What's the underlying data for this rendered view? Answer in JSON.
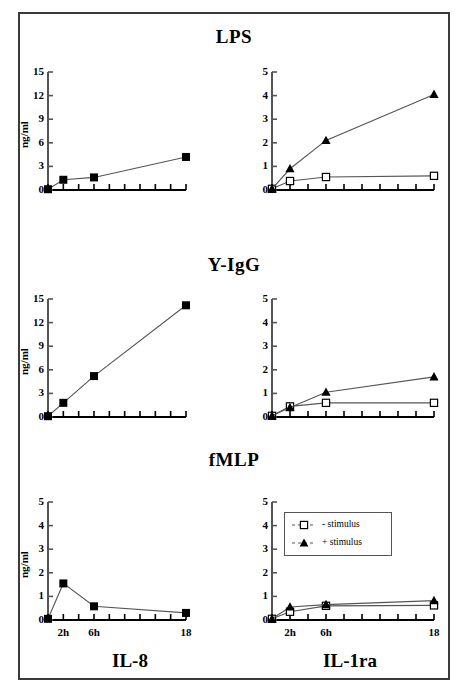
{
  "figure": {
    "ylabel": "ng/ml",
    "column_labels": [
      "IL-8",
      "IL-1ra"
    ],
    "row_titles": [
      "LPS",
      "Y-IgG",
      "fMLP"
    ],
    "xtick_labels": [
      "2h",
      "6h",
      "18"
    ],
    "legend": {
      "entries": [
        {
          "label": "- stimulus",
          "marker": "open-square"
        },
        {
          "label": "+ stimulus",
          "marker": "filled-triangle"
        }
      ]
    },
    "colors": {
      "ink": "#000000",
      "frame": "#3a3a3a",
      "line": "#555555"
    }
  },
  "chart_data": [
    {
      "type": "line",
      "title": "LPS",
      "panel": "IL-8",
      "xlabel": "",
      "ylabel": "ng/ml",
      "x": [
        0,
        2,
        6,
        18
      ],
      "xtick_values": [
        0,
        2,
        4,
        6,
        8,
        10,
        12,
        14,
        16,
        18
      ],
      "xlim": [
        0,
        18
      ],
      "ylim": [
        0,
        15
      ],
      "yticks": [
        0,
        3,
        6,
        9,
        12,
        15
      ],
      "grid": false,
      "series": [
        {
          "name": "IL-8",
          "marker": "filled-square",
          "values": [
            0.1,
            1.3,
            1.6,
            4.2
          ]
        }
      ]
    },
    {
      "type": "line",
      "title": "LPS",
      "panel": "IL-1ra",
      "xlabel": "",
      "ylabel": "",
      "x": [
        0,
        2,
        6,
        18
      ],
      "xtick_values": [
        0,
        2,
        4,
        6,
        8,
        10,
        12,
        14,
        16,
        18
      ],
      "xlim": [
        0,
        18
      ],
      "ylim": [
        0,
        5
      ],
      "yticks": [
        0,
        1,
        2,
        3,
        4,
        5
      ],
      "grid": false,
      "series": [
        {
          "name": "- stimulus",
          "marker": "open-square",
          "values": [
            0.05,
            0.38,
            0.55,
            0.6
          ]
        },
        {
          "name": "+ stimulus",
          "marker": "filled-triangle",
          "values": [
            0.05,
            0.9,
            2.1,
            4.05
          ]
        }
      ]
    },
    {
      "type": "line",
      "title": "Y-IgG",
      "panel": "IL-8",
      "xlabel": "",
      "ylabel": "ng/ml",
      "x": [
        0,
        2,
        6,
        18
      ],
      "xtick_values": [
        0,
        2,
        4,
        6,
        8,
        10,
        12,
        14,
        16,
        18
      ],
      "xlim": [
        0,
        18
      ],
      "ylim": [
        0,
        15
      ],
      "yticks": [
        0,
        3,
        6,
        9,
        12,
        15
      ],
      "grid": false,
      "series": [
        {
          "name": "IL-8",
          "marker": "filled-square",
          "values": [
            0.1,
            1.8,
            5.2,
            14.2
          ]
        }
      ]
    },
    {
      "type": "line",
      "title": "Y-IgG",
      "panel": "IL-1ra",
      "xlabel": "",
      "ylabel": "",
      "x": [
        0,
        2,
        6,
        18
      ],
      "xtick_values": [
        0,
        2,
        4,
        6,
        8,
        10,
        12,
        14,
        16,
        18
      ],
      "xlim": [
        0,
        18
      ],
      "ylim": [
        0,
        5
      ],
      "yticks": [
        0,
        1,
        2,
        3,
        4,
        5
      ],
      "grid": false,
      "series": [
        {
          "name": "- stimulus",
          "marker": "open-square",
          "values": [
            0.05,
            0.45,
            0.6,
            0.6
          ]
        },
        {
          "name": "+ stimulus",
          "marker": "filled-triangle",
          "values": [
            0.05,
            0.4,
            1.05,
            1.7
          ]
        }
      ]
    },
    {
      "type": "line",
      "title": "fMLP",
      "panel": "IL-8",
      "xlabel": "",
      "ylabel": "ng/ml",
      "x": [
        0,
        2,
        6,
        18
      ],
      "xtick_values": [
        0,
        2,
        4,
        6,
        8,
        10,
        12,
        14,
        16,
        18
      ],
      "xlim": [
        0,
        18
      ],
      "ylim": [
        0,
        5
      ],
      "yticks": [
        0,
        1,
        2,
        3,
        4,
        5
      ],
      "grid": false,
      "series": [
        {
          "name": "IL-8",
          "marker": "filled-square",
          "values": [
            0.05,
            1.55,
            0.58,
            0.3
          ]
        }
      ]
    },
    {
      "type": "line",
      "title": "fMLP",
      "panel": "IL-1ra",
      "xlabel": "",
      "ylabel": "",
      "x": [
        0,
        2,
        6,
        18
      ],
      "xtick_values": [
        0,
        2,
        4,
        6,
        8,
        10,
        12,
        14,
        16,
        18
      ],
      "xlim": [
        0,
        18
      ],
      "ylim": [
        0,
        5
      ],
      "yticks": [
        0,
        1,
        2,
        3,
        4,
        5
      ],
      "grid": false,
      "has_legend": true,
      "series": [
        {
          "name": "- stimulus",
          "marker": "open-square",
          "values": [
            0.05,
            0.35,
            0.6,
            0.62
          ]
        },
        {
          "name": "+ stimulus",
          "marker": "filled-triangle",
          "values": [
            0.05,
            0.55,
            0.65,
            0.82
          ]
        }
      ]
    }
  ]
}
